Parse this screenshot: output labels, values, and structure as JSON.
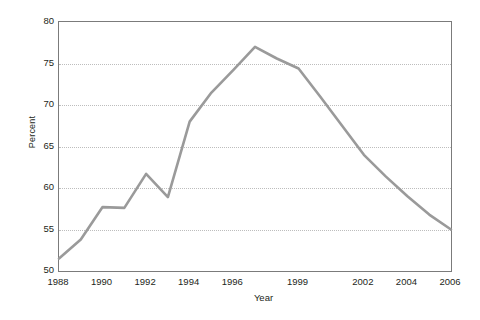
{
  "chart_data": {
    "type": "line",
    "title": "",
    "xlabel": "Year",
    "ylabel": "Percent",
    "ylim": [
      50,
      80
    ],
    "ytick_values": [
      50,
      55,
      60,
      65,
      70,
      75,
      80
    ],
    "ytick_labels": [
      "50",
      "55",
      "60",
      "65",
      "70",
      "75",
      "80"
    ],
    "xtick_labels": [
      "1988",
      "1990",
      "1992",
      "1994",
      "1996",
      "1999",
      "2002",
      "2004",
      "2006"
    ],
    "xtick_index": [
      0,
      2,
      4,
      6,
      8,
      11,
      14,
      16,
      18
    ],
    "grid": true,
    "legend": "none",
    "line_color": "#9a9a9a",
    "line_width": 2.6,
    "axis_color": "#7b7b7b",
    "grid_color": "#bdbdbd",
    "background": "#ffffff",
    "categories": [
      "1988",
      "1989",
      "1990",
      "1991",
      "1992",
      "1993",
      "1994",
      "1995",
      "1996",
      "1997",
      "1998",
      "1999",
      "2000",
      "2001",
      "2002",
      "2003",
      "2004",
      "2005",
      "2006"
    ],
    "series": [
      {
        "name": "Percent",
        "values": [
          51.5,
          53.8,
          57.7,
          57.6,
          61.7,
          58.9,
          68.0,
          71.5,
          74.2,
          77.0,
          75.6,
          74.4,
          71.0,
          67.5,
          64.0,
          61.4,
          59.0,
          56.8,
          55.0
        ]
      }
    ]
  }
}
